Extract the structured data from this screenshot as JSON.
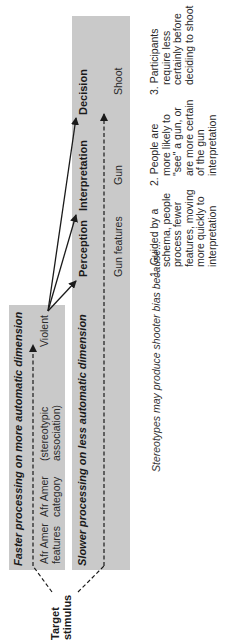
{
  "diagram": {
    "stimulus_label_line1": "Target",
    "stimulus_label_line2": "stimulus",
    "fast_path": {
      "title": "Faster processing on more automatic dimension",
      "node1_line1": "Afr Amer",
      "node1_line2": "features",
      "node2_line1": "Afr Amer",
      "node2_line2": "category",
      "node3_line1": "(stereotypic",
      "node3_line2": "association)",
      "node4": "Violent"
    },
    "slow_path": {
      "title": "Slower processing on less automatic dimension",
      "stages": [
        "Perception",
        "Interpretation",
        "Decision"
      ],
      "values": [
        "Gun features",
        "Gun",
        "Shoot"
      ]
    },
    "caption": "Stereotypes may produce shooter bias because...",
    "reasons": [
      {
        "line1": "1. Guided by a",
        "line2": "schema, people",
        "line3": "process fewer",
        "line4": "features, moving",
        "line5": "more quickly to",
        "line6": "interpretation"
      },
      {
        "line1": "2. People are",
        "line2": "more likely to",
        "line3": "\"see\" a gun, or",
        "line4": "are more certain",
        "line5": "of the gun",
        "line6": "interpretation"
      },
      {
        "line1": "3. Participants",
        "line2": "require less",
        "line3": "certainly before",
        "line4": "deciding to shoot"
      }
    ],
    "colors": {
      "box_fill": "#c9c9c9",
      "line": "#1a1a1a",
      "background": "#ffffff"
    }
  }
}
